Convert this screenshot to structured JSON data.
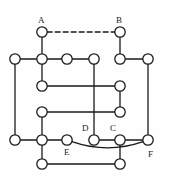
{
  "figure": {
    "title": "",
    "type": "graph-diagram",
    "width": 169,
    "height": 189,
    "background_color": "#fefefe",
    "stroke_color": "#1a1a1a",
    "node_fill_color": "#ffffff",
    "node_radius": 5.2,
    "edge_width": 1.3,
    "dashed_pattern": "5,3"
  },
  "chart_data": {
    "type": "diagram",
    "title": "",
    "nodes": [
      {
        "id": "n_A",
        "label": "A",
        "x": 42,
        "y": 32,
        "label_dx": -4,
        "label_dy": -16
      },
      {
        "id": "n_B",
        "label": "B",
        "x": 120,
        "y": 32,
        "label_dx": -4,
        "label_dy": -16
      },
      {
        "id": "n_r2c0",
        "label": "",
        "x": 15,
        "y": 59
      },
      {
        "id": "n_r2c1",
        "label": "",
        "x": 42,
        "y": 59
      },
      {
        "id": "n_r2c2",
        "label": "",
        "x": 67,
        "y": 59
      },
      {
        "id": "n_r2c3",
        "label": "",
        "x": 94,
        "y": 59
      },
      {
        "id": "n_r2c4",
        "label": "",
        "x": 120,
        "y": 59
      },
      {
        "id": "n_r2c5",
        "label": "",
        "x": 148,
        "y": 59
      },
      {
        "id": "n_r3c1",
        "label": "",
        "x": 42,
        "y": 86
      },
      {
        "id": "n_r3c4",
        "label": "",
        "x": 120,
        "y": 86
      },
      {
        "id": "n_r4c1",
        "label": "",
        "x": 42,
        "y": 112
      },
      {
        "id": "n_r4c4",
        "label": "",
        "x": 120,
        "y": 112
      },
      {
        "id": "n_r5c0",
        "label": "",
        "x": 15,
        "y": 140
      },
      {
        "id": "n_r5c1",
        "label": "",
        "x": 42,
        "y": 140
      },
      {
        "id": "n_E",
        "label": "E",
        "x": 67,
        "y": 140,
        "label_dx": -3,
        "label_dy": 8
      },
      {
        "id": "n_D",
        "label": "D",
        "x": 94,
        "y": 140,
        "label_dx": -12,
        "label_dy": -16
      },
      {
        "id": "n_C",
        "label": "C",
        "x": 120,
        "y": 140,
        "label_dx": -10,
        "label_dy": -16
      },
      {
        "id": "n_F",
        "label": "F",
        "x": 148,
        "y": 140,
        "label_dx": 0,
        "label_dy": 10
      },
      {
        "id": "n_r6c1",
        "label": "",
        "x": 42,
        "y": 164
      },
      {
        "id": "n_r6c4",
        "label": "",
        "x": 120,
        "y": 164
      }
    ],
    "edges": [
      {
        "from": "n_A",
        "to": "n_B",
        "style": "dashed",
        "path": "straight"
      },
      {
        "from": "n_A",
        "to": "n_r2c1",
        "style": "solid",
        "path": "straight"
      },
      {
        "from": "n_B",
        "to": "n_r2c4",
        "style": "solid",
        "path": "straight"
      },
      {
        "from": "n_r2c0",
        "to": "n_r2c1",
        "style": "solid",
        "path": "straight"
      },
      {
        "from": "n_r2c1",
        "to": "n_r2c2",
        "style": "solid",
        "path": "straight"
      },
      {
        "from": "n_r2c2",
        "to": "n_r2c3",
        "style": "solid",
        "path": "straight"
      },
      {
        "from": "n_r2c4",
        "to": "n_r2c5",
        "style": "solid",
        "path": "straight"
      },
      {
        "from": "n_r2c0",
        "to": "n_r5c0",
        "style": "solid",
        "path": "straight"
      },
      {
        "from": "n_r2c1",
        "to": "n_r3c1",
        "style": "solid",
        "path": "straight"
      },
      {
        "from": "n_r2c3",
        "to": "n_D",
        "style": "solid",
        "path": "straight"
      },
      {
        "from": "n_r2c5",
        "to": "n_F",
        "style": "solid",
        "path": "straight"
      },
      {
        "from": "n_r3c1",
        "to": "n_r3c4",
        "style": "solid",
        "path": "straight"
      },
      {
        "from": "n_r3c4",
        "to": "n_r4c4",
        "style": "solid",
        "path": "straight"
      },
      {
        "from": "n_r4c1",
        "to": "n_r4c4",
        "style": "solid",
        "path": "straight"
      },
      {
        "from": "n_r4c1",
        "to": "n_r5c1",
        "style": "solid",
        "path": "straight"
      },
      {
        "from": "n_r5c0",
        "to": "n_r5c1",
        "style": "solid",
        "path": "straight"
      },
      {
        "from": "n_r5c1",
        "to": "n_E",
        "style": "solid",
        "path": "straight"
      },
      {
        "from": "n_D",
        "to": "n_C",
        "style": "solid",
        "path": "straight"
      },
      {
        "from": "n_C",
        "to": "n_F",
        "style": "solid",
        "path": "straight"
      },
      {
        "from": "n_r5c1",
        "to": "n_r6c1",
        "style": "solid",
        "path": "straight"
      },
      {
        "from": "n_C",
        "to": "n_r6c4",
        "style": "solid",
        "path": "straight"
      },
      {
        "from": "n_r6c1",
        "to": "n_r6c4",
        "style": "solid",
        "path": "straight"
      },
      {
        "from": "n_E",
        "to": "n_F",
        "style": "solid",
        "path": "curve",
        "curve_dy": 14
      }
    ],
    "labels": [
      "A",
      "B",
      "C",
      "D",
      "E",
      "F"
    ]
  }
}
